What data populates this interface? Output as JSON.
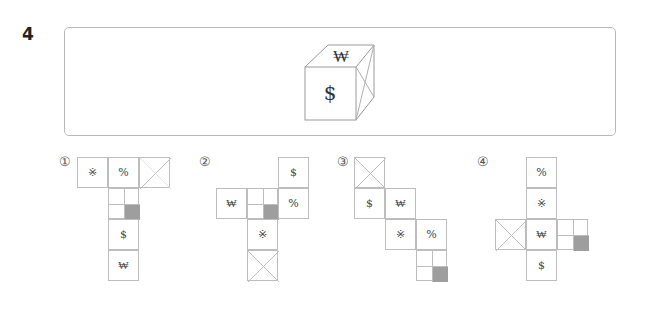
{
  "question": {
    "number": "4",
    "cube": {
      "front_symbol": "$",
      "top_symbol": "₩",
      "right_face": "x-cross"
    }
  },
  "options": [
    {
      "label": "①",
      "cells": [
        {
          "col": 0,
          "row": 0,
          "type": "symbol",
          "symbol": "※"
        },
        {
          "col": 1,
          "row": 0,
          "type": "symbol",
          "symbol": "%"
        },
        {
          "col": 2,
          "row": 0,
          "type": "diagonal-cross"
        },
        {
          "col": 1,
          "row": 1,
          "type": "quadrant-shaded"
        },
        {
          "col": 1,
          "row": 2,
          "type": "symbol",
          "symbol": "$"
        },
        {
          "col": 1,
          "row": 3,
          "type": "symbol",
          "symbol": "₩"
        }
      ]
    },
    {
      "label": "②",
      "cells": [
        {
          "col": 2,
          "row": 0,
          "type": "symbol",
          "symbol": "$"
        },
        {
          "col": 0,
          "row": 1,
          "type": "symbol",
          "symbol": "₩"
        },
        {
          "col": 1,
          "row": 1,
          "type": "quadrant-shaded"
        },
        {
          "col": 2,
          "row": 1,
          "type": "symbol",
          "symbol": "%"
        },
        {
          "col": 1,
          "row": 2,
          "type": "symbol",
          "symbol": "※"
        },
        {
          "col": 1,
          "row": 3,
          "type": "x-cross"
        }
      ]
    },
    {
      "label": "③",
      "cells": [
        {
          "col": 0,
          "row": 0,
          "type": "x-cross"
        },
        {
          "col": 0,
          "row": 1,
          "type": "symbol",
          "symbol": "$"
        },
        {
          "col": 1,
          "row": 1,
          "type": "symbol",
          "symbol": "₩"
        },
        {
          "col": 1,
          "row": 2,
          "type": "symbol",
          "symbol": "※"
        },
        {
          "col": 2,
          "row": 2,
          "type": "symbol",
          "symbol": "%"
        },
        {
          "col": 2,
          "row": 3,
          "type": "quadrant-shaded"
        }
      ]
    },
    {
      "label": "④",
      "cells": [
        {
          "col": 1,
          "row": 0,
          "type": "symbol",
          "symbol": "%"
        },
        {
          "col": 1,
          "row": 1,
          "type": "symbol",
          "symbol": "※"
        },
        {
          "col": 0,
          "row": 2,
          "type": "x-cross"
        },
        {
          "col": 1,
          "row": 2,
          "type": "symbol",
          "symbol": "₩"
        },
        {
          "col": 2,
          "row": 2,
          "type": "quadrant-shaded"
        },
        {
          "col": 1,
          "row": 3,
          "type": "symbol",
          "symbol": "$"
        }
      ]
    }
  ],
  "colors": {
    "line": "#bdbdbd",
    "shade": "#9e9e9e",
    "text": "#444444"
  }
}
